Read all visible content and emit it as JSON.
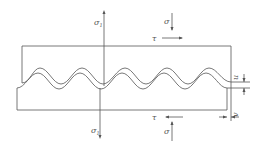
{
  "diagram": {
    "labels": {
      "sigma1_top": "σ",
      "sigma1_top_sub": "1",
      "sigma_top": "σ",
      "tau_top": "τ",
      "tau_bottom": "τ",
      "sigma1_bottom": "σ",
      "sigma1_bottom_sub": "1",
      "sigma_bottom": "σ",
      "u_label": "u",
      "v_label": "v"
    },
    "colors": {
      "line": "#555555",
      "background": "#ffffff"
    }
  }
}
